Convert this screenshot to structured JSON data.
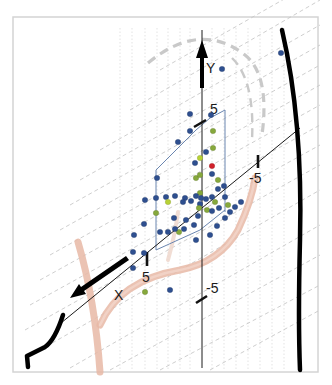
{
  "chart_data": {
    "type": "scatter",
    "title": "",
    "projection": "3d-oblique",
    "axes": {
      "x": {
        "label": "X",
        "ticks": [
          "5",
          "-5"
        ]
      },
      "y": {
        "label": "Y",
        "ticks": [
          "5",
          "-5"
        ]
      },
      "z": {
        "label": "",
        "ticks": [
          "-5"
        ]
      }
    },
    "tick_labels": {
      "y_pos": "5",
      "y_neg": "-5",
      "x_pos": "5",
      "z_neg": "-5"
    },
    "series": [
      {
        "name": "blue",
        "color": "#2e4f8f"
      },
      {
        "name": "green",
        "color": "#86a83c"
      },
      {
        "name": "yellow-green",
        "color": "#b7d136"
      },
      {
        "name": "red",
        "color": "#d0202a"
      }
    ],
    "points": [
      {
        "x": 222,
        "y": 69,
        "s": "blue"
      },
      {
        "x": 281,
        "y": 53,
        "s": "blue"
      },
      {
        "x": 190,
        "y": 114,
        "s": "blue"
      },
      {
        "x": 211,
        "y": 115,
        "s": "blue"
      },
      {
        "x": 190,
        "y": 131,
        "s": "blue"
      },
      {
        "x": 178,
        "y": 142,
        "s": "blue"
      },
      {
        "x": 213,
        "y": 131,
        "s": "green"
      },
      {
        "x": 213,
        "y": 148,
        "s": "green"
      },
      {
        "x": 206,
        "y": 152,
        "s": "blue"
      },
      {
        "x": 200,
        "y": 158,
        "s": "yellow-green"
      },
      {
        "x": 195,
        "y": 163,
        "s": "blue"
      },
      {
        "x": 212,
        "y": 166,
        "s": "red"
      },
      {
        "x": 212,
        "y": 174,
        "s": "blue"
      },
      {
        "x": 196,
        "y": 178,
        "s": "green"
      },
      {
        "x": 200,
        "y": 175,
        "s": "green"
      },
      {
        "x": 218,
        "y": 180,
        "s": "green"
      },
      {
        "x": 218,
        "y": 189,
        "s": "blue"
      },
      {
        "x": 224,
        "y": 186,
        "s": "blue"
      },
      {
        "x": 225,
        "y": 197,
        "s": "blue"
      },
      {
        "x": 200,
        "y": 193,
        "s": "green"
      },
      {
        "x": 185,
        "y": 198,
        "s": "blue"
      },
      {
        "x": 175,
        "y": 196,
        "s": "blue"
      },
      {
        "x": 166,
        "y": 197,
        "s": "blue"
      },
      {
        "x": 156,
        "y": 198,
        "s": "blue"
      },
      {
        "x": 157,
        "y": 178,
        "s": "blue"
      },
      {
        "x": 168,
        "y": 202,
        "s": "yellow-green"
      },
      {
        "x": 183,
        "y": 202,
        "s": "blue"
      },
      {
        "x": 191,
        "y": 201,
        "s": "blue"
      },
      {
        "x": 196,
        "y": 196,
        "s": "blue"
      },
      {
        "x": 201,
        "y": 198,
        "s": "blue"
      },
      {
        "x": 200,
        "y": 204,
        "s": "blue"
      },
      {
        "x": 206,
        "y": 199,
        "s": "blue"
      },
      {
        "x": 212,
        "y": 197,
        "s": "blue"
      },
      {
        "x": 215,
        "y": 202,
        "s": "green"
      },
      {
        "x": 199,
        "y": 208,
        "s": "green"
      },
      {
        "x": 207,
        "y": 210,
        "s": "green"
      },
      {
        "x": 212,
        "y": 211,
        "s": "blue"
      },
      {
        "x": 219,
        "y": 208,
        "s": "blue"
      },
      {
        "x": 228,
        "y": 205,
        "s": "green"
      },
      {
        "x": 235,
        "y": 207,
        "s": "blue"
      },
      {
        "x": 241,
        "y": 202,
        "s": "blue"
      },
      {
        "x": 225,
        "y": 218,
        "s": "blue"
      },
      {
        "x": 230,
        "y": 212,
        "s": "blue"
      },
      {
        "x": 156,
        "y": 213,
        "s": "green"
      },
      {
        "x": 174,
        "y": 218,
        "s": "blue"
      },
      {
        "x": 186,
        "y": 220,
        "s": "blue"
      },
      {
        "x": 198,
        "y": 216,
        "s": "blue"
      },
      {
        "x": 194,
        "y": 225,
        "s": "blue"
      },
      {
        "x": 184,
        "y": 229,
        "s": "blue"
      },
      {
        "x": 179,
        "y": 232,
        "s": "green"
      },
      {
        "x": 175,
        "y": 229,
        "s": "blue"
      },
      {
        "x": 168,
        "y": 232,
        "s": "blue"
      },
      {
        "x": 196,
        "y": 240,
        "s": "blue"
      },
      {
        "x": 210,
        "y": 235,
        "s": "blue"
      },
      {
        "x": 217,
        "y": 226,
        "s": "blue"
      },
      {
        "x": 145,
        "y": 200,
        "s": "blue"
      },
      {
        "x": 144,
        "y": 224,
        "s": "blue"
      },
      {
        "x": 134,
        "y": 235,
        "s": "blue"
      },
      {
        "x": 144,
        "y": 253,
        "s": "blue"
      },
      {
        "x": 133,
        "y": 252,
        "s": "blue"
      },
      {
        "x": 133,
        "y": 268,
        "s": "blue"
      },
      {
        "x": 145,
        "y": 292,
        "s": "green"
      },
      {
        "x": 170,
        "y": 290,
        "s": "blue"
      },
      {
        "x": 160,
        "y": 232,
        "s": "blue"
      }
    ]
  }
}
